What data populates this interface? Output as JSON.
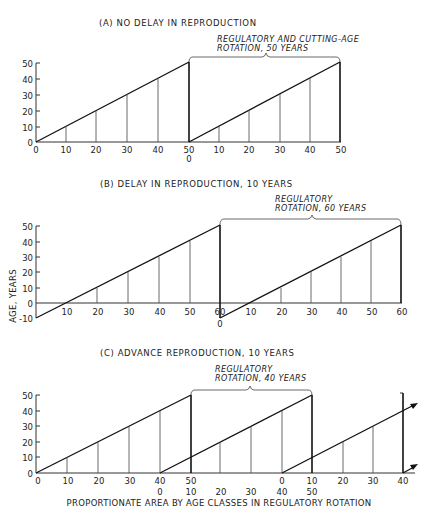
{
  "figure": {
    "y_axis_label": "AGE, YEARS",
    "x_axis_label": "PROPORTIONATE AREA BY AGE CLASSES IN REGULATORY ROTATION",
    "panels": [
      {
        "id": "A",
        "title": "(A) NO DELAY IN REPRODUCTION",
        "note_line1": "REGULATORY AND CUTTING-AGE",
        "note_line2": "ROTATION, 50 YEARS",
        "y_ticks": [
          "50",
          "40",
          "30",
          "20",
          "10",
          "0"
        ],
        "x_ticks_row1": [
          "0",
          "10",
          "20",
          "30",
          "40",
          "50",
          "10",
          "20",
          "30",
          "40",
          "50"
        ],
        "x_ticks_row2": [
          "0"
        ]
      },
      {
        "id": "B",
        "title": "(B) DELAY IN REPRODUCTION, 10 YEARS",
        "note_line1": "REGULATORY",
        "note_line2": "ROTATION, 60 YEARS",
        "y_ticks": [
          "50",
          "40",
          "30",
          "20",
          "10",
          "0",
          "-10"
        ],
        "x_ticks_row1": [
          "10",
          "20",
          "30",
          "40",
          "50",
          "60",
          "10",
          "20",
          "30",
          "40",
          "50",
          "60"
        ],
        "x_ticks_row2": [
          "0"
        ]
      },
      {
        "id": "C",
        "title": "(C) ADVANCE REPRODUCTION, 10 YEARS",
        "note_line1": "REGULATORY",
        "note_line2": "ROTATION, 40 YEARS",
        "y_ticks": [
          "50",
          "40",
          "30",
          "20",
          "10",
          "0"
        ],
        "x_ticks_row1": [
          "0",
          "10",
          "20",
          "30",
          "40",
          "50",
          "0",
          "10",
          "20",
          "30",
          "40"
        ],
        "x_ticks_row2": [
          "0",
          "10",
          "20",
          "30",
          "40",
          "50"
        ]
      }
    ]
  }
}
